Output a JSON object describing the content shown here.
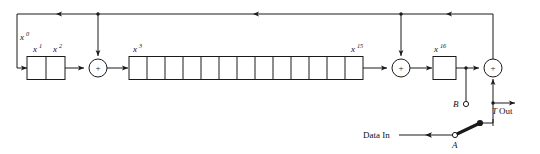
{
  "diagram": {
    "labels": {
      "tap_x0": "x",
      "tap_x0_sup": "0",
      "stage_x1": "x",
      "stage_x1_sup": "1",
      "stage_x2": "x",
      "stage_x2_sup": "2",
      "stage_x3": "x",
      "stage_x3_sup": "3",
      "stage_x15": "x",
      "stage_x15_sup": "15",
      "stage_x16": "x",
      "stage_x16_sup": "16",
      "adder_symbol": "+",
      "terminal_b": "B",
      "terminal_a": "A",
      "data_in": "Data In",
      "t_out_prefix": "T",
      "t_out_suffix": "Out"
    },
    "registers": {
      "first_group_cells": 2,
      "middle_group_cells": 13,
      "last_group_cells": 1,
      "total_stages": 16
    },
    "adders": [
      {
        "name": "adder-1",
        "symbol": "+"
      },
      {
        "name": "adder-2",
        "symbol": "+"
      },
      {
        "name": "adder-3",
        "symbol": "+"
      }
    ],
    "colors": {
      "line": "#1a1a1a",
      "background": "#ffffff",
      "text": "#111111"
    }
  }
}
